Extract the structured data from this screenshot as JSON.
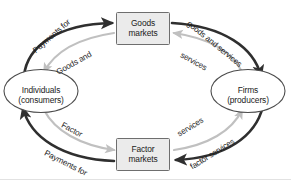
{
  "diagram": {
    "nodes": {
      "goods_markets": {
        "line1": "Goods",
        "line2": "markets",
        "shape": "rectangle"
      },
      "factor_markets": {
        "line1": "Factor",
        "line2": "markets",
        "shape": "rectangle"
      },
      "individuals": {
        "line1": "Individuals",
        "line2": "(consumers)",
        "shape": "ellipse"
      },
      "firms": {
        "line1": "Firms",
        "line2": "(producers)",
        "shape": "ellipse"
      }
    },
    "flows": {
      "payments_for_goods": "Payments for",
      "goods_and": "Goods and",
      "goods_and_services": "goods and services",
      "services_top": "services",
      "factor": "Factor",
      "payments_for_factor": "Payments for",
      "services_bottom": "services",
      "factor_services": "factor services"
    },
    "colors": {
      "outer_flow": "#2f2f2f",
      "inner_flow": "#c0c0c0",
      "node_fill": "#ebebeb",
      "node_stroke": "#6e6e6e",
      "text": "#1a1a1a",
      "background": "#ffffff"
    }
  }
}
